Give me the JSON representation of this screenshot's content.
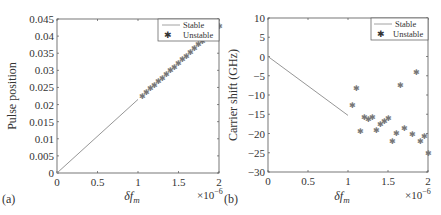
{
  "chart_data": [
    {
      "panel": "(a)",
      "type": "line",
      "title": "",
      "xlabel": "δf_m",
      "ylabel": "Pulse position",
      "x_multiplier": "×10^-6",
      "xlim": [
        0,
        2
      ],
      "ylim": [
        0,
        0.045
      ],
      "xticks": [
        "0",
        "0.5",
        "1",
        "1.5",
        "2"
      ],
      "yticks": [
        "0",
        "0.005",
        "0.01",
        "0.015",
        "0.02",
        "0.025",
        "0.03",
        "0.035",
        "0.04",
        "0.045"
      ],
      "grid": false,
      "legend_position": "top-right",
      "series": [
        {
          "name": "Stable",
          "style": "line",
          "x": [
            0,
            1.0
          ],
          "y": [
            0,
            0.0215
          ]
        },
        {
          "name": "Unstable",
          "style": "marker-star",
          "x": [
            1.05,
            1.1,
            1.15,
            1.2,
            1.25,
            1.3,
            1.35,
            1.4,
            1.45,
            1.5,
            1.55,
            1.6,
            1.65,
            1.7,
            1.75,
            1.8,
            1.85,
            1.9,
            1.95,
            2.0
          ],
          "y": [
            0.0225,
            0.0236,
            0.0247,
            0.0257,
            0.0268,
            0.0279,
            0.029,
            0.03,
            0.0311,
            0.0322,
            0.0333,
            0.0343,
            0.0354,
            0.0365,
            0.0376,
            0.0386,
            0.0397,
            0.0408,
            0.0419,
            0.043
          ]
        }
      ]
    },
    {
      "panel": "(b)",
      "type": "scatter",
      "title": "",
      "xlabel": "δf_m",
      "ylabel": "Carrier shift (GHz)",
      "x_multiplier": "×10^-6",
      "xlim": [
        0,
        2
      ],
      "ylim": [
        -30,
        10
      ],
      "xticks": [
        "0",
        "0.5",
        "1",
        "1.5",
        "2"
      ],
      "yticks": [
        "-30",
        "-25",
        "-20",
        "-15",
        "-10",
        "-5",
        "0",
        "5",
        "10"
      ],
      "grid": false,
      "legend_position": "top-right",
      "series": [
        {
          "name": "Stable",
          "style": "line",
          "x": [
            0,
            1.0
          ],
          "y": [
            0,
            -15.3
          ]
        },
        {
          "name": "Unstable",
          "style": "marker-star",
          "x": [
            1.05,
            1.1,
            1.15,
            1.2,
            1.25,
            1.3,
            1.35,
            1.4,
            1.45,
            1.5,
            1.55,
            1.6,
            1.65,
            1.7,
            1.8,
            1.85,
            1.9,
            1.95,
            2.0
          ],
          "y": [
            -12.7,
            -8.1,
            -19.4,
            -15.6,
            -16.3,
            -15.7,
            -19.1,
            -17.6,
            -16.8,
            -16.1,
            -21.9,
            -19.8,
            -7.4,
            -18.5,
            -20.0,
            -4.1,
            -21.9,
            -20.6,
            -25.0
          ]
        }
      ]
    }
  ],
  "panels": {
    "a": {
      "label": "(a)",
      "ylabel": "Pulse position",
      "xlabel_main": "δf",
      "xlabel_sub": "m",
      "multiplier": "×10",
      "multiplier_exp": "−6",
      "xticks": [
        "0",
        "0.5",
        "1",
        "1.5",
        "2"
      ],
      "yticks": [
        "0",
        "0.005",
        "0.01",
        "0.015",
        "0.02",
        "0.025",
        "0.03",
        "0.035",
        "0.04",
        "0.045"
      ],
      "legend": {
        "stable": "Stable",
        "unstable": "Unstable"
      }
    },
    "b": {
      "label": "(b)",
      "ylabel": "Carrier shift (GHz)",
      "xlabel_main": "δf",
      "xlabel_sub": "m",
      "multiplier": "×10",
      "multiplier_exp": "−6",
      "xticks": [
        "0",
        "0.5",
        "1",
        "1.5",
        "2"
      ],
      "yticks": [
        "−30",
        "−25",
        "−20",
        "−15",
        "−10",
        "−5",
        "0",
        "5",
        "10"
      ],
      "legend": {
        "stable": "Stable",
        "unstable": "Unstable"
      }
    }
  },
  "colors": {
    "axis": "#555555",
    "line": "#8a8a8a",
    "marker": "#777777",
    "text": "#333333"
  }
}
